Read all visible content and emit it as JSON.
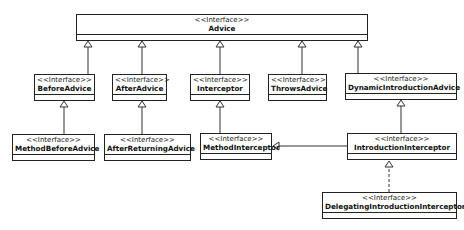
{
  "diagram": {
    "type": "uml-class-diagram",
    "stereotype": "<<Interface>>",
    "classes": [
      {
        "id": "advice",
        "stereotype": "<<Interface>>",
        "name": "Advice",
        "x": 76,
        "y": 14,
        "w": 292,
        "h": 27
      },
      {
        "id": "before-advice",
        "stereotype": "<<Interface>>",
        "name": "BeforeAdvice",
        "x": 34,
        "y": 74,
        "w": 61,
        "h": 27
      },
      {
        "id": "after-advice",
        "stereotype": "<<Interface>>",
        "name": "AfterAdvice",
        "x": 112,
        "y": 74,
        "w": 55,
        "h": 27
      },
      {
        "id": "interceptor",
        "stereotype": "<<Interface>>",
        "name": "Interceptor",
        "x": 190,
        "y": 74,
        "w": 60,
        "h": 27
      },
      {
        "id": "throws-advice",
        "stereotype": "<<Interface>>",
        "name": "ThrowsAdvice",
        "x": 268,
        "y": 74,
        "w": 59,
        "h": 27
      },
      {
        "id": "dynamic-introduction-advice",
        "stereotype": "<<Interface>>",
        "name": "DynamicIntroductionAdvice",
        "x": 345,
        "y": 73,
        "w": 112,
        "h": 27
      },
      {
        "id": "method-before-advice",
        "stereotype": "<<Interface>>",
        "name": "MethodBeforeAdvice",
        "x": 12,
        "y": 134,
        "w": 83,
        "h": 27
      },
      {
        "id": "after-returning-advice",
        "stereotype": "<<Interface>>",
        "name": "AfterReturningAdvice",
        "x": 104,
        "y": 134,
        "w": 87,
        "h": 27
      },
      {
        "id": "method-interceptor",
        "stereotype": "<<Interface>>",
        "name": "MethodInterceptor",
        "x": 200,
        "y": 133,
        "w": 72,
        "h": 27
      },
      {
        "id": "introduction-interceptor",
        "stereotype": "<<Interface>>",
        "name": "IntroductionInterceptor",
        "x": 347,
        "y": 133,
        "w": 110,
        "h": 27
      },
      {
        "id": "delegating-introduction-interceptor",
        "stereotype": "<<Interface>>",
        "name": "DelegatingIntroductionInterceptor",
        "x": 322,
        "y": 192,
        "w": 135,
        "h": 27
      }
    ],
    "relations": [
      {
        "from": "BeforeAdvice",
        "to": "Advice",
        "kind": "generalization",
        "style": "solid"
      },
      {
        "from": "AfterAdvice",
        "to": "Advice",
        "kind": "generalization",
        "style": "solid"
      },
      {
        "from": "Interceptor",
        "to": "Advice",
        "kind": "generalization",
        "style": "solid"
      },
      {
        "from": "ThrowsAdvice",
        "to": "Advice",
        "kind": "generalization",
        "style": "solid"
      },
      {
        "from": "DynamicIntroductionAdvice",
        "to": "Advice",
        "kind": "generalization",
        "style": "solid"
      },
      {
        "from": "MethodBeforeAdvice",
        "to": "BeforeAdvice",
        "kind": "generalization",
        "style": "solid"
      },
      {
        "from": "AfterReturningAdvice",
        "to": "AfterAdvice",
        "kind": "generalization",
        "style": "solid"
      },
      {
        "from": "MethodInterceptor",
        "to": "Interceptor",
        "kind": "generalization",
        "style": "solid"
      },
      {
        "from": "IntroductionInterceptor",
        "to": "DynamicIntroductionAdvice",
        "kind": "generalization",
        "style": "solid"
      },
      {
        "from": "IntroductionInterceptor",
        "to": "MethodInterceptor",
        "kind": "generalization",
        "style": "solid"
      },
      {
        "from": "DelegatingIntroductionInterceptor",
        "to": "IntroductionInterceptor",
        "kind": "realization",
        "style": "dashed"
      }
    ],
    "colors": {
      "stroke": "#222222",
      "background": "#ffffff",
      "text": "#111111"
    }
  }
}
